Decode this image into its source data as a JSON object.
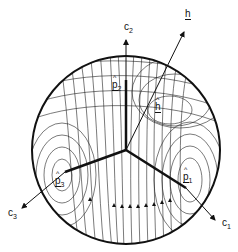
{
  "figure": {
    "sphere": {
      "cx": 126,
      "cy": 150,
      "r": 94
    },
    "origin": {
      "x": 126,
      "y": 150
    },
    "colors": {
      "ink": "#111111",
      "background": "#ffffff"
    }
  },
  "labels": {
    "c1": {
      "text": "c",
      "sub": "1"
    },
    "c2": {
      "text": "c",
      "sub": "2"
    },
    "c3": {
      "text": "c",
      "sub": "3"
    },
    "h": {
      "text": "h"
    },
    "h_hat": {
      "text": "h"
    },
    "p1": {
      "text": "p",
      "sub": "1"
    },
    "p2": {
      "text": "p",
      "sub": "2"
    },
    "p3": {
      "text": "p",
      "sub": "3"
    }
  }
}
